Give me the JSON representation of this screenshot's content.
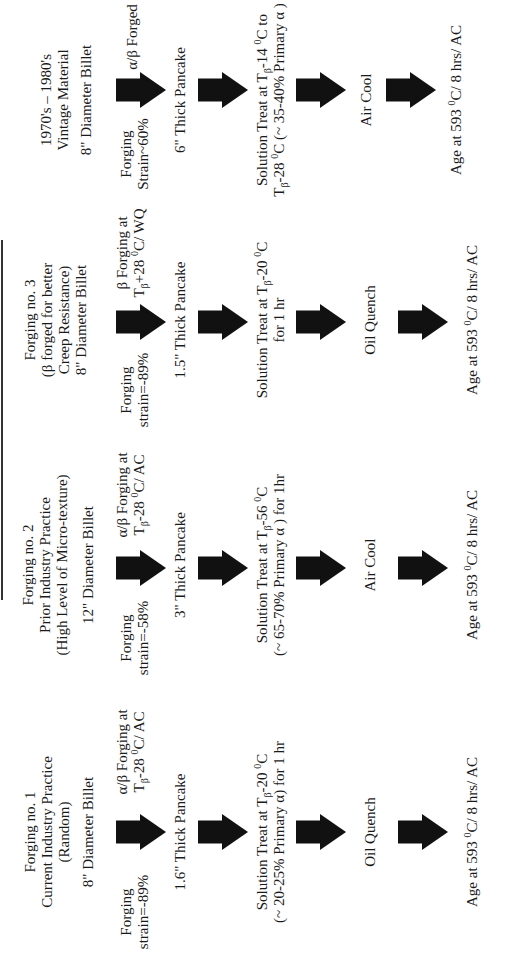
{
  "diagram": {
    "type": "process-flow",
    "orientation": "rotated-90-ccw",
    "columns": [
      {
        "id": "forging-1",
        "title_lines": [
          "Forging no. 1",
          "Current Industry Practice",
          "(Random)"
        ],
        "billet": "8\" Diameter Billet",
        "forging_strain_lines": [
          "Forging",
          "strain=-89%"
        ],
        "forging_process_lines": [
          "α/β Forging at",
          "Tβ-28 °C/ AC"
        ],
        "pancake": "1.6\" Thick Pancake",
        "solution_treat_lines": [
          "Solution Treat at Tβ-20 °C",
          "(~ 20-25% Primary α) for 1 hr"
        ],
        "cooling": "Oil Quench",
        "age": "Age at 593 °C/ 8 hrs/ AC"
      },
      {
        "id": "forging-2",
        "title_lines": [
          "Forging no. 2",
          "Prior Industry Practice",
          "(High Level of Micro-texture)"
        ],
        "billet": "12\" Diameter Billet",
        "forging_strain_lines": [
          "Forging",
          "strain=-58%"
        ],
        "forging_process_lines": [
          "α/β Forging at",
          "Tβ-28 °C/ AC"
        ],
        "pancake": "3\" Thick Pancake",
        "solution_treat_lines": [
          "Solution Treat at Tβ-56 °C",
          "(~ 65-70% Primary α ) for 1hr"
        ],
        "cooling": "Air Cool",
        "age": "Age at 593 °C/ 8 hrs/ AC"
      },
      {
        "id": "forging-3",
        "title_lines": [
          "Forging no. 3",
          "(β forged for better",
          "Creep Resistance)"
        ],
        "billet": "8\" Diameter Billet",
        "forging_strain_lines": [
          "Forging",
          "strain=-89%"
        ],
        "forging_process_lines": [
          "β Forging at",
          "Tβ+28 °C/ WQ"
        ],
        "pancake": "1.5\" Thick Pancake",
        "solution_treat_lines": [
          "Solution Treat at Tβ-20 °C",
          "for 1 hr"
        ],
        "cooling": "Oil Quench",
        "age": "Age at 593 °C/ 8 hrs/ AC"
      },
      {
        "id": "vintage",
        "title_lines": [
          "1970's – 1980's",
          "Vintage Material"
        ],
        "billet": "8\" Diameter Billet",
        "forging_strain_lines": [
          "Forging",
          "Strain~60%"
        ],
        "forging_process_lines": [
          "α/β Forged"
        ],
        "pancake": "6\" Thick Pancake",
        "solution_treat_lines": [
          "Solution Treat at Tβ-14 °C to",
          "Tβ-28 °C (~ 35-40% Primary α )"
        ],
        "cooling": "Air Cool",
        "age": "Age at 593 °C/ 8 hrs/ AC"
      }
    ],
    "icons": {
      "arrow": "down-arrow-icon"
    },
    "colors": {
      "ink": "#111111",
      "background": "#ffffff"
    }
  }
}
